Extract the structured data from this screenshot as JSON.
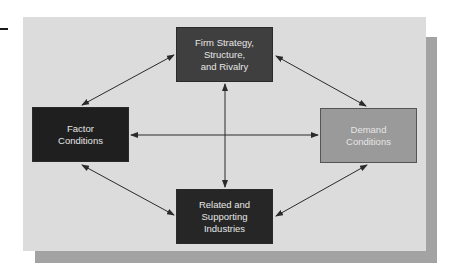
{
  "diagram": {
    "nodes": [
      {
        "id": "firm",
        "lines": [
          "Firm Strategy,",
          "Structure,",
          "and Rivalry"
        ],
        "fill": "#3f3f3f"
      },
      {
        "id": "factor",
        "lines": [
          "Factor",
          "Conditions"
        ],
        "fill": "#1f1f1f"
      },
      {
        "id": "demand",
        "lines": [
          "Demand",
          "Conditions"
        ],
        "fill": "#9a9a9a"
      },
      {
        "id": "related",
        "lines": [
          "Related and",
          "Supporting",
          "Industries"
        ],
        "fill": "#262626"
      }
    ],
    "edges": [
      {
        "from": "firm",
        "to": "factor",
        "type": "bidirectional"
      },
      {
        "from": "firm",
        "to": "demand",
        "type": "bidirectional"
      },
      {
        "from": "firm",
        "to": "related",
        "type": "bidirectional"
      },
      {
        "from": "factor",
        "to": "demand",
        "type": "bidirectional"
      },
      {
        "from": "factor",
        "to": "related",
        "type": "bidirectional"
      },
      {
        "from": "demand",
        "to": "related",
        "type": "bidirectional"
      }
    ],
    "colors": {
      "panel": "#dcdcdc",
      "shadow": "#a3a3a3",
      "arrow": "#2a2a2a",
      "text": "#e6e6e6"
    }
  }
}
